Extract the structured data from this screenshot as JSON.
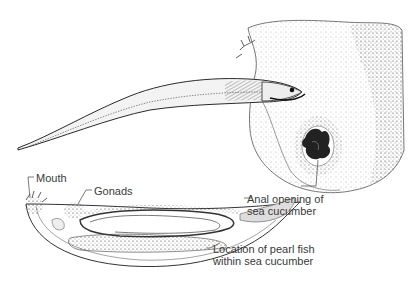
{
  "figure": {
    "top_illustration": "pearl fish entering sea cucumber",
    "bottom_illustration": "cross-section of sea cucumber with pearl fish inside"
  },
  "labels": {
    "mouth": "Mouth",
    "gonads": "Gonads",
    "anal_opening_line1": "Anal opening of",
    "anal_opening_line2": "sea cucumber",
    "location_line1": "Location of pearl fish",
    "location_line2": "within sea cucumber"
  },
  "colors": {
    "ink": "#2a2a2a",
    "background": "#ffffff",
    "label_text": "#3a3a3a"
  }
}
